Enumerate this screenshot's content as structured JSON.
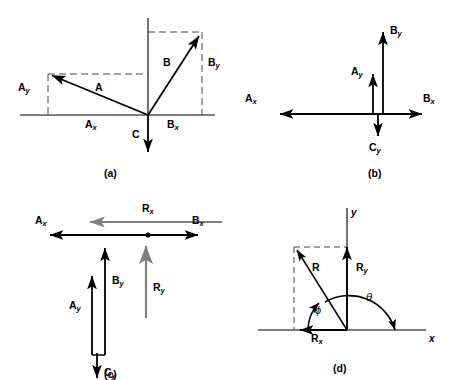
{
  "figure": {
    "colors": {
      "stroke": "#000000",
      "gray": "#808080",
      "dashed": "#555555",
      "background": "#ffffff"
    }
  },
  "panels": [
    {
      "id": "a",
      "caption": "(a)",
      "description": "Vectors A, B and C drawn from a common origin with dashed component projections",
      "labels": [
        {
          "name": "vector-a-label",
          "base": "A",
          "sub": ""
        },
        {
          "name": "vector-ax-label",
          "base": "A",
          "sub": "x"
        },
        {
          "name": "vector-ay-label",
          "base": "A",
          "sub": "y"
        },
        {
          "name": "vector-b-label",
          "base": "B",
          "sub": ""
        },
        {
          "name": "vector-bx-label",
          "base": "B",
          "sub": "x"
        },
        {
          "name": "vector-by-label",
          "base": "B",
          "sub": "y"
        },
        {
          "name": "vector-c-label",
          "base": "C",
          "sub": ""
        }
      ]
    },
    {
      "id": "b",
      "caption": "(b)",
      "description": "The x and y components of A, B and C redrawn along the axes",
      "labels": [
        {
          "name": "vector-ax-label",
          "base": "A",
          "sub": "x"
        },
        {
          "name": "vector-ay-label",
          "base": "A",
          "sub": "y"
        },
        {
          "name": "vector-bx-label",
          "base": "B",
          "sub": "x"
        },
        {
          "name": "vector-by-label",
          "base": "B",
          "sub": "y"
        },
        {
          "name": "vector-cy-label",
          "base": "C",
          "sub": "y"
        }
      ]
    },
    {
      "id": "c",
      "caption": "(c)",
      "description": "Components added head to tail giving resultants Rx and Ry",
      "labels": [
        {
          "name": "vector-ax-label",
          "base": "A",
          "sub": "x"
        },
        {
          "name": "vector-bx-label",
          "base": "B",
          "sub": "x"
        },
        {
          "name": "vector-rx-label",
          "base": "R",
          "sub": "x"
        },
        {
          "name": "vector-ay-label",
          "base": "A",
          "sub": "y"
        },
        {
          "name": "vector-by-label",
          "base": "B",
          "sub": "y"
        },
        {
          "name": "vector-cy-label",
          "base": "C",
          "sub": "y"
        },
        {
          "name": "vector-ry-label",
          "base": "R",
          "sub": "y"
        }
      ]
    },
    {
      "id": "d",
      "caption": "(d)",
      "description": "Resultant R formed from Rx and Ry with angles phi and theta",
      "labels": [
        {
          "name": "vector-r-label",
          "base": "R",
          "sub": ""
        },
        {
          "name": "vector-rx-label",
          "base": "R",
          "sub": "x"
        },
        {
          "name": "vector-ry-label",
          "base": "R",
          "sub": "y"
        },
        {
          "name": "axis-x-label",
          "base": "x",
          "sub": ""
        },
        {
          "name": "axis-y-label",
          "base": "y",
          "sub": ""
        },
        {
          "name": "angle-phi-label",
          "base": "ϕ",
          "sub": ""
        },
        {
          "name": "angle-theta-label",
          "base": "θ",
          "sub": ""
        }
      ]
    }
  ],
  "captions": {
    "a": "(a)",
    "b": "(b)",
    "c": "(c)",
    "d": "(d)"
  },
  "text": {
    "A": "A",
    "B": "B",
    "C": "C",
    "R": "R",
    "x": "x",
    "y": "y",
    "phi": "ϕ",
    "theta": "θ"
  }
}
